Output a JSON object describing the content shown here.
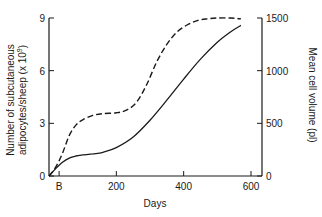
{
  "chart_data": {
    "type": "line",
    "title": "",
    "xlabel": "Days",
    "ylabel": "Number of subcutaneous adipocytes/sheep (x 10^9)",
    "ylabel_line1": "Number of subcutaneous",
    "ylabel_line2": "adipocytes/sheep (x 10",
    "ylabel_sup": "9",
    "ylabel_end": ")",
    "y2label": "Mean cell volume (pl)",
    "xlim": [
      0,
      630
    ],
    "ylim": [
      0,
      9
    ],
    "y2lim": [
      0,
      1500
    ],
    "x_ticks": [
      {
        "value": 30,
        "label": "B"
      },
      {
        "value": 200,
        "label": "200"
      },
      {
        "value": 400,
        "label": "400"
      },
      {
        "value": 600,
        "label": "600"
      }
    ],
    "y_ticks": [
      {
        "value": 0,
        "label": "0"
      },
      {
        "value": 3,
        "label": "3"
      },
      {
        "value": 6,
        "label": "6"
      },
      {
        "value": 9,
        "label": "9"
      }
    ],
    "y2_ticks": [
      {
        "value": 0,
        "label": "0"
      },
      {
        "value": 500,
        "label": "500"
      },
      {
        "value": 1000,
        "label": "1000"
      },
      {
        "value": 1500,
        "label": "1500"
      }
    ],
    "grid": false,
    "legend": "none",
    "series": [
      {
        "name": "Number of subcutaneous adipocytes/sheep (x 10^9)",
        "axis": "left",
        "style": "dashed",
        "x": [
          0,
          20,
          40,
          60,
          80,
          100,
          130,
          160,
          200,
          230,
          260,
          290,
          320,
          350,
          380,
          410,
          440,
          470,
          500,
          540,
          570
        ],
        "values": [
          0,
          0.5,
          1.3,
          2.3,
          2.9,
          3.2,
          3.45,
          3.55,
          3.6,
          3.75,
          4.2,
          5.2,
          6.5,
          7.5,
          8.2,
          8.6,
          8.85,
          8.95,
          9.0,
          9.0,
          8.95
        ]
      },
      {
        "name": "Mean cell volume (pl)",
        "axis": "right",
        "style": "solid",
        "x": [
          0,
          20,
          40,
          60,
          80,
          100,
          130,
          160,
          200,
          250,
          300,
          350,
          400,
          450,
          500,
          540,
          570
        ],
        "values": [
          0,
          70,
          130,
          170,
          190,
          200,
          210,
          225,
          270,
          370,
          530,
          720,
          920,
          1110,
          1270,
          1370,
          1430
        ]
      }
    ]
  }
}
